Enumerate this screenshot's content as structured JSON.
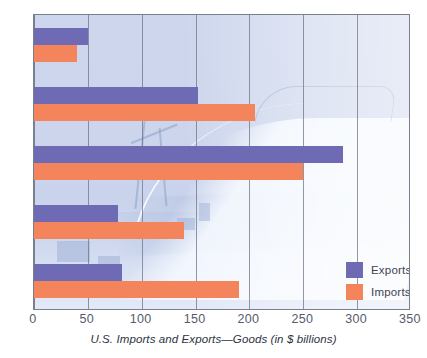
{
  "chart_data": {
    "type": "bar",
    "orientation": "horizontal",
    "title": "",
    "caption": "U.S. Imports and Exports—Goods (in $ billions)",
    "xlabel": "U.S. Imports and Exports—Goods (in $ billions)",
    "ylabel": "",
    "xlim": [
      0,
      350
    ],
    "xticks": [
      0,
      50,
      100,
      150,
      200,
      250,
      300,
      350
    ],
    "xtick_labels": [
      "0",
      "50",
      "100",
      "150",
      "200",
      "250",
      "300",
      "350"
    ],
    "grid": true,
    "grid_axis": "x",
    "legend_position": "inside-bottom-right",
    "categories": [
      "Group 1",
      "Group 2",
      "Group 3",
      "Group 4",
      "Group 5"
    ],
    "series": [
      {
        "name": "Exports",
        "color": "#6f6ab4",
        "values": [
          50,
          152,
          287,
          78,
          82
        ]
      },
      {
        "name": "Imports",
        "color": "#f4845c",
        "values": [
          40,
          205,
          250,
          139,
          190
        ]
      }
    ]
  },
  "legend": {
    "items": [
      {
        "label": "Exports",
        "color": "#6f6ab4"
      },
      {
        "label": "Imports",
        "color": "#f4845c"
      }
    ]
  },
  "colors": {
    "exports": "#6f6ab4",
    "imports": "#f4845c",
    "plot_background": "#ccd5ec",
    "gridline": "#6e7688",
    "frame": "#7a7f8c",
    "tick_text": "#555b6b",
    "caption_text": "#2e3340"
  }
}
